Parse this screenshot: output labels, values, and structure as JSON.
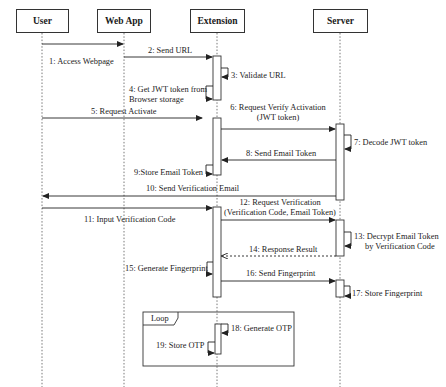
{
  "diagram": {
    "type": "sequence",
    "actors": [
      {
        "id": "user",
        "label": "User"
      },
      {
        "id": "webapp",
        "label": "Web App"
      },
      {
        "id": "extension",
        "label": "Extension"
      },
      {
        "id": "server",
        "label": "Server"
      }
    ],
    "messages": [
      {
        "n": 1,
        "label": "1: Access Webpage",
        "from": "user",
        "to": "webapp",
        "style": "solid"
      },
      {
        "n": 2,
        "label": "2: Send URL",
        "from": "webapp",
        "to": "extension",
        "style": "solid"
      },
      {
        "n": 3,
        "label": "3: Validate URL",
        "from": "extension",
        "to": "extension",
        "style": "self"
      },
      {
        "n": 4,
        "label": "4: Get JWT token from",
        "label2": "Browser storage",
        "from": "extension",
        "to": "extension",
        "style": "self"
      },
      {
        "n": 5,
        "label": "5: Request Activate",
        "from": "user",
        "to": "extension",
        "style": "solid"
      },
      {
        "n": 6,
        "label": "6: Request Verify Activation",
        "label2": "(JWT token)",
        "from": "extension",
        "to": "server",
        "style": "solid"
      },
      {
        "n": 7,
        "label": "7: Decode JWT token",
        "from": "server",
        "to": "server",
        "style": "self"
      },
      {
        "n": 8,
        "label": "8: Send Email Token",
        "from": "server",
        "to": "extension",
        "style": "solid"
      },
      {
        "n": 9,
        "label": "9:Store Email Token",
        "from": "extension",
        "to": "extension",
        "style": "self"
      },
      {
        "n": 10,
        "label": "10: Send Verification Email",
        "from": "server",
        "to": "user",
        "style": "solid"
      },
      {
        "n": 11,
        "label": "11: Input Verification Code",
        "from": "user",
        "to": "extension",
        "style": "solid"
      },
      {
        "n": 12,
        "label": "12: Request Verification",
        "label2": "(Verification Code, Email Token)",
        "from": "extension",
        "to": "server",
        "style": "solid"
      },
      {
        "n": 13,
        "label": "13: Decrypt Email Token",
        "label2": "by Verification Code",
        "from": "server",
        "to": "server",
        "style": "self"
      },
      {
        "n": 14,
        "label": "14: Response Result",
        "from": "server",
        "to": "extension",
        "style": "dashed"
      },
      {
        "n": 15,
        "label": "15: Generate Fingerprint",
        "from": "extension",
        "to": "extension",
        "style": "self"
      },
      {
        "n": 16,
        "label": "16: Send Fingerprint",
        "from": "extension",
        "to": "server",
        "style": "solid"
      },
      {
        "n": 17,
        "label": "17: Store Fingerprint",
        "from": "server",
        "to": "server",
        "style": "self"
      },
      {
        "n": 18,
        "label": "18: Generate OTP",
        "from": "extension",
        "to": "extension",
        "style": "self"
      },
      {
        "n": 19,
        "label": "19: Store OTP",
        "from": "extension",
        "to": "extension",
        "style": "self"
      }
    ],
    "fragments": [
      {
        "kind": "loop",
        "label": "Loop",
        "contains": [
          18,
          19
        ]
      }
    ]
  }
}
